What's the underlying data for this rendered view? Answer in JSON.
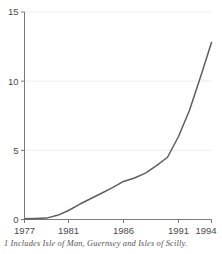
{
  "chart_data": {
    "type": "line",
    "title": "",
    "subtitle": "",
    "xlabel": "",
    "ylabel": "",
    "xlim": [
      1977,
      1994
    ],
    "ylim": [
      0,
      15
    ],
    "grid": true,
    "legend": null,
    "x_ticks": [
      1977,
      1981,
      1986,
      1991,
      1994
    ],
    "x_tick_labels": [
      "1977",
      "1981",
      "1986",
      "1991",
      "1994"
    ],
    "y_ticks": [
      0,
      5,
      10,
      15
    ],
    "y_tick_labels": [
      "0",
      "5",
      "10",
      "15"
    ],
    "line_color": "#5e5e5e",
    "series": [
      {
        "name": "series-1",
        "x": [
          1977,
          1978,
          1979,
          1980,
          1981,
          1982,
          1983,
          1984,
          1985,
          1986,
          1987,
          1988,
          1989,
          1990,
          1991,
          1992,
          1993,
          1994
        ],
        "values": [
          0.05,
          0.07,
          0.1,
          0.3,
          0.65,
          1.1,
          1.5,
          1.9,
          2.3,
          2.75,
          3.0,
          3.35,
          3.9,
          4.5,
          6.0,
          7.9,
          10.3,
          12.8
        ]
      }
    ],
    "annotations": [
      "1 Includes Isle of Man, Guernsey and Isles of Scilly."
    ]
  },
  "footnote": {
    "text": "1 Includes Isle of Man, Guernsey and Isles of Scilly."
  }
}
